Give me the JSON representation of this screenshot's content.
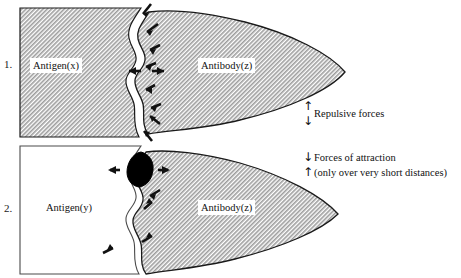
{
  "figure": {
    "background_color": "#ffffff",
    "hatch_fill_color": "#b9b9b9",
    "outline_color": "#1a1a1a",
    "blob_color": "#000000"
  },
  "panels": [
    {
      "number": "1.",
      "antigen_label": "Antigen(x)",
      "antibody_label": "Antibody(z)",
      "antigen_filled": true,
      "interface_gap": true,
      "arrow_count": 9,
      "note": "poor fit - gap between antigen(x) and antibody(z)"
    },
    {
      "number": "2.",
      "antigen_label": "Antigen(y)",
      "antibody_label": "Antibody(z)",
      "antigen_filled": false,
      "interface_gap": true,
      "arrow_count": 5,
      "blob": true,
      "note": "close fit at black contact blob between antigen(y) and antibody(z)"
    }
  ],
  "annotations": [
    {
      "id": "repulsive",
      "arrow_top": "↑",
      "arrow_bottom": "↓",
      "line1": "Repulsive forces",
      "line2": ""
    },
    {
      "id": "attraction",
      "arrow_top": "↓",
      "arrow_bottom": "↑",
      "line1": "Forces of attraction",
      "line2": "(only over very short distances)"
    }
  ]
}
